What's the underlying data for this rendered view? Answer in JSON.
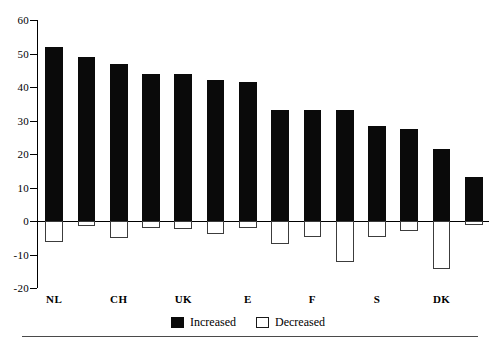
{
  "chart_data": {
    "type": "bar",
    "title": "",
    "subtitle": "",
    "xlabel": "",
    "ylabel": "",
    "ylim": [
      -20,
      60
    ],
    "ytick_labels": [
      "60",
      "50",
      "40",
      "30",
      "20",
      "10",
      "0",
      "-10",
      "-20"
    ],
    "ytick_values": [
      60,
      50,
      40,
      30,
      20,
      10,
      0,
      -10,
      -20
    ],
    "grid": false,
    "legend_position": "bottom-center",
    "categories": [
      "NL",
      "",
      "CH",
      "",
      "UK",
      "",
      "E",
      "",
      "F",
      "",
      "S",
      "",
      "DK",
      ""
    ],
    "visible_category_labels": [
      "NL",
      "CH",
      "UK",
      "E",
      "F",
      "S",
      "DK"
    ],
    "series": [
      {
        "name": "Increased",
        "color": "#0a0a0a",
        "values": [
          52,
          49,
          47,
          44,
          44,
          42,
          41.5,
          33,
          33,
          33,
          28.5,
          27.5,
          21.5,
          13
        ]
      },
      {
        "name": "Decreased",
        "color": "#ffffff",
        "values": [
          -6.2,
          -1.6,
          -5,
          -2.2,
          -2.3,
          -3.9,
          -2.1,
          -7,
          -4.8,
          -12.2,
          -4.8,
          -2.9,
          -14.4,
          -1.2
        ]
      }
    ]
  },
  "legend": {
    "entries": [
      {
        "label": "Increased",
        "swatch": "filled-square"
      },
      {
        "label": "Decreased",
        "swatch": "open-square"
      }
    ]
  },
  "colors": {
    "increased": "#0a0a0a",
    "decreased_fill": "#ffffff",
    "decreased_stroke": "#3c3c3c",
    "axis": "#000000",
    "background": "#ffffff"
  }
}
